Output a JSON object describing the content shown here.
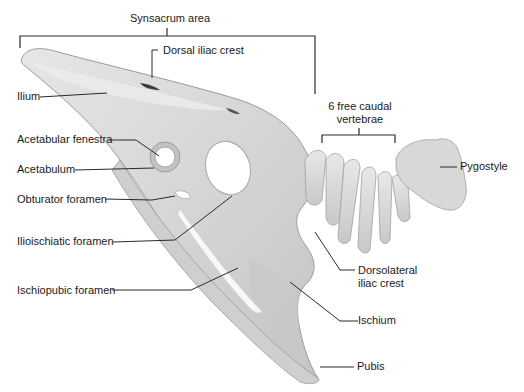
{
  "diagram": {
    "labels": {
      "synsacrum_area": "Synsacrum area",
      "dorsal_iliac_crest": "Dorsal iliac crest",
      "ilium": "Ilium",
      "free_caudal_line1": "6 free caudal",
      "free_caudal_line2": "vertebrae",
      "acetabular_fenestra": "Acetabular fenestra",
      "acetabulum": "Acetabulum",
      "obturator_foramen": "Obturator foramen",
      "ilioischiatic_foramen": "Ilioischiatic foramen",
      "ischiopubic_foramen": "Ischiopubic foramen",
      "pygostyle": "Pygostyle",
      "dorsolateral_line1": "Dorsolateral",
      "dorsolateral_line2": "iliac crest",
      "ischium": "Ischium",
      "pubis": "Pubis"
    },
    "colors": {
      "bone_fill": "#d9d9d9",
      "bone_shadow": "#b3b3b3",
      "bone_outline": "#9a9a9a",
      "leader_line": "#2a2a2a",
      "background": "#ffffff"
    }
  }
}
